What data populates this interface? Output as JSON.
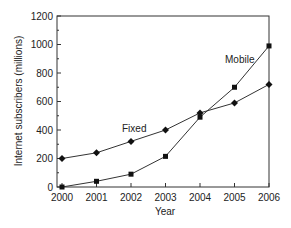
{
  "chart_data": {
    "type": "line",
    "title": "",
    "xlabel": "Year",
    "ylabel": "Internet subscribers (millions)",
    "x": [
      2000,
      2001,
      2002,
      2003,
      2004,
      2005,
      2006
    ],
    "xticks": [
      "2000",
      "2001",
      "2002",
      "2003",
      "2004",
      "2005",
      "2006"
    ],
    "yticks": [
      "0",
      "200",
      "400",
      "600",
      "800",
      "1000",
      "1200"
    ],
    "ylim": [
      0,
      1200
    ],
    "grid": false,
    "legend_position": "inline labels",
    "series": [
      {
        "name": "Fixed",
        "marker": "diamond",
        "values": [
          200,
          240,
          320,
          400,
          520,
          590,
          720
        ]
      },
      {
        "name": "Mobile",
        "marker": "square",
        "values": [
          0,
          40,
          90,
          215,
          490,
          700,
          990
        ]
      }
    ],
    "annotations": [
      {
        "text": "Fixed",
        "near": "2002.5, 400"
      },
      {
        "text": "Mobile",
        "near": "2005.3, 830"
      }
    ]
  }
}
